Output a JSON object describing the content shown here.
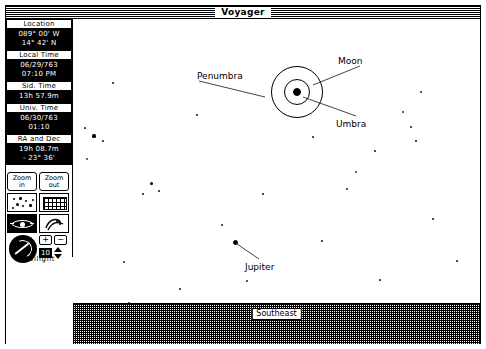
{
  "window": {
    "title": "Voyager"
  },
  "sidebar": {
    "panels": [
      {
        "name": "location",
        "header": "Location",
        "lines": [
          "089° 00' W",
          "14° 42' N"
        ]
      },
      {
        "name": "local-time",
        "header": "Local Time",
        "lines": [
          "06/29/763",
          "07:10 PM"
        ]
      },
      {
        "name": "sidereal-time",
        "header": "Sid. Time",
        "lines": [
          "13h 57.9m"
        ]
      },
      {
        "name": "universal-time",
        "header": "Univ. Time",
        "lines": [
          "06/30/763",
          "01:10"
        ]
      },
      {
        "name": "ra-and-dec",
        "header": "RA and Dec",
        "lines": [
          "19h 08.7m",
          "- 23° 36'"
        ]
      }
    ],
    "buttons": {
      "zoom_in_line1": "Zoom",
      "zoom_in_line2": "in",
      "zoom_out_line1": "Zoom",
      "zoom_out_line2": "out"
    },
    "icons": {
      "stars": "star-field-icon",
      "grid": "coordinate-grid-icon",
      "horizon": "horizon-eye-icon",
      "rotate": "rotate-sky-icon",
      "dial": "time-dial-icon",
      "plus": "+",
      "minus": "−",
      "step_value": "10",
      "stepper": "up-down-stepper-icon"
    },
    "footer_label": "Twilight"
  },
  "sky": {
    "compass_label": "Southeast",
    "annotations": [
      {
        "name": "penumbra-label",
        "text": "Penumbra",
        "x": 124,
        "y": 52
      },
      {
        "name": "moon-label",
        "text": "Moon",
        "x": 265,
        "y": 37
      },
      {
        "name": "umbra-label",
        "text": "Umbra",
        "x": 263,
        "y": 100
      },
      {
        "name": "jupiter-label",
        "text": "Jupiter",
        "x": 172,
        "y": 243
      }
    ],
    "objects": [
      {
        "name": "moon",
        "type": "disk",
        "cx": 224,
        "cy": 73,
        "r": 4
      },
      {
        "name": "umbra-ring",
        "type": "ring",
        "cx": 224,
        "cy": 73,
        "r": 13
      },
      {
        "name": "penumbra-ring",
        "type": "ring",
        "cx": 224,
        "cy": 73,
        "r": 26
      },
      {
        "name": "jupiter",
        "type": "disk",
        "cx": 162,
        "cy": 223,
        "r": 2.5
      }
    ],
    "stars": [
      {
        "x": 21,
        "y": 117,
        "r": 1.6,
        "bright": true
      },
      {
        "x": 14,
        "y": 140,
        "r": 1.1,
        "bright": false
      },
      {
        "x": 30,
        "y": 122,
        "r": 0.6,
        "bright": false
      },
      {
        "x": 12,
        "y": 109,
        "r": 0.6,
        "bright": false
      },
      {
        "x": 78,
        "y": 164,
        "r": 1.5,
        "bright": true
      },
      {
        "x": 70,
        "y": 175,
        "r": 0.6,
        "bright": false
      },
      {
        "x": 86,
        "y": 172,
        "r": 0.6,
        "bright": false
      },
      {
        "x": 51,
        "y": 243,
        "r": 0.8,
        "bright": false
      },
      {
        "x": 107,
        "y": 270,
        "r": 0.8,
        "bright": false
      },
      {
        "x": 56,
        "y": 284,
        "r": 0.7,
        "bright": false
      },
      {
        "x": 149,
        "y": 206,
        "r": 0.7,
        "bright": false
      },
      {
        "x": 190,
        "y": 175,
        "r": 0.6,
        "bright": false
      },
      {
        "x": 174,
        "y": 262,
        "r": 0.7,
        "bright": false
      },
      {
        "x": 210,
        "y": 288,
        "r": 0.6,
        "bright": false
      },
      {
        "x": 249,
        "y": 222,
        "r": 0.6,
        "bright": false
      },
      {
        "x": 283,
        "y": 153,
        "r": 0.9,
        "bright": false
      },
      {
        "x": 274,
        "y": 170,
        "r": 0.7,
        "bright": false
      },
      {
        "x": 302,
        "y": 132,
        "r": 0.6,
        "bright": false
      },
      {
        "x": 330,
        "y": 93,
        "r": 0.8,
        "bright": false
      },
      {
        "x": 338,
        "y": 108,
        "r": 0.6,
        "bright": false
      },
      {
        "x": 348,
        "y": 73,
        "r": 0.7,
        "bright": false
      },
      {
        "x": 343,
        "y": 122,
        "r": 0.6,
        "bright": false
      },
      {
        "x": 307,
        "y": 261,
        "r": 0.6,
        "bright": false
      },
      {
        "x": 360,
        "y": 200,
        "r": 0.6,
        "bright": false
      },
      {
        "x": 384,
        "y": 242,
        "r": 0.6,
        "bright": false
      },
      {
        "x": 240,
        "y": 118,
        "r": 0.6,
        "bright": false
      },
      {
        "x": 124,
        "y": 96,
        "r": 0.6,
        "bright": false
      },
      {
        "x": 40,
        "y": 64,
        "r": 0.6,
        "bright": false
      }
    ]
  }
}
